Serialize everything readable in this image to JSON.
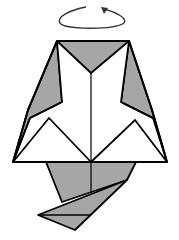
{
  "diagram": {
    "type": "origami-fold-step",
    "instruction": "turn model over",
    "colors": {
      "paper_back": "#a6a6a6",
      "paper_front": "#ffffff",
      "stroke": "#000000",
      "arrow": "#333333"
    },
    "symbols": [
      {
        "name": "turn-over-arrow",
        "description": "looping arrow indicating turn over"
      }
    ],
    "parts": [
      "top-flap",
      "left-wing",
      "right-wing",
      "left-triangle",
      "right-triangle",
      "center-crease",
      "bottom-tail"
    ]
  }
}
